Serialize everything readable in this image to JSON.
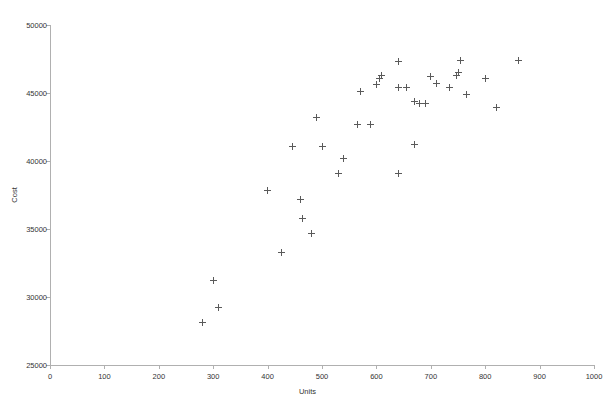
{
  "chart_data": {
    "type": "scatter",
    "title": "",
    "xlabel": "Units",
    "ylabel": "Cost",
    "xlim": [
      0,
      1000
    ],
    "ylim": [
      25000,
      50000
    ],
    "xticks": [
      0,
      100,
      200,
      300,
      400,
      500,
      600,
      700,
      800,
      900,
      1000
    ],
    "yticks": [
      25000,
      30000,
      35000,
      40000,
      45000,
      50000
    ],
    "xtick_labels": [
      "0",
      "100",
      "200",
      "300",
      "400",
      "500",
      "600",
      "700",
      "800",
      "900",
      "1000"
    ],
    "ytick_labels": [
      "25000",
      "30000",
      "35000",
      "40000",
      "45000",
      "50000"
    ],
    "grid": false,
    "legend": null,
    "marker": "plus",
    "marker_color": "#5a5a5a",
    "axis_color": "#b0b0b0",
    "points": [
      {
        "x": 280,
        "y": 28100
      },
      {
        "x": 310,
        "y": 29200
      },
      {
        "x": 300,
        "y": 31200
      },
      {
        "x": 425,
        "y": 33300
      },
      {
        "x": 400,
        "y": 37800
      },
      {
        "x": 480,
        "y": 34700
      },
      {
        "x": 465,
        "y": 35800
      },
      {
        "x": 460,
        "y": 37200
      },
      {
        "x": 445,
        "y": 41100
      },
      {
        "x": 500,
        "y": 41100
      },
      {
        "x": 490,
        "y": 43200
      },
      {
        "x": 530,
        "y": 39100
      },
      {
        "x": 540,
        "y": 40200
      },
      {
        "x": 565,
        "y": 42700
      },
      {
        "x": 590,
        "y": 42700
      },
      {
        "x": 570,
        "y": 45100
      },
      {
        "x": 640,
        "y": 39100
      },
      {
        "x": 670,
        "y": 41200
      },
      {
        "x": 600,
        "y": 45600
      },
      {
        "x": 605,
        "y": 46100
      },
      {
        "x": 610,
        "y": 46300
      },
      {
        "x": 640,
        "y": 47300
      },
      {
        "x": 640,
        "y": 45400
      },
      {
        "x": 655,
        "y": 45400
      },
      {
        "x": 670,
        "y": 44400
      },
      {
        "x": 680,
        "y": 44200
      },
      {
        "x": 690,
        "y": 44200
      },
      {
        "x": 700,
        "y": 46200
      },
      {
        "x": 710,
        "y": 45700
      },
      {
        "x": 735,
        "y": 45400
      },
      {
        "x": 755,
        "y": 47400
      },
      {
        "x": 750,
        "y": 46500
      },
      {
        "x": 748,
        "y": 46300
      },
      {
        "x": 765,
        "y": 44900
      },
      {
        "x": 800,
        "y": 46100
      },
      {
        "x": 820,
        "y": 43900
      },
      {
        "x": 862,
        "y": 47400
      }
    ]
  }
}
